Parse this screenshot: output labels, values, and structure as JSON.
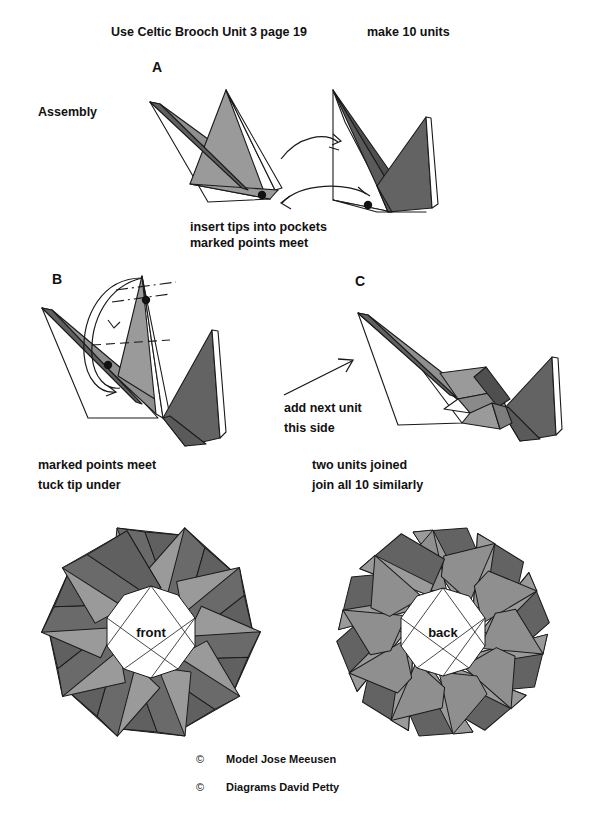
{
  "document": {
    "type": "origami-instruction-diagram",
    "title_line": "Use Celtic Brooch Unit 3 page 19",
    "units_note": "make 10 units",
    "section_label": "Assembly"
  },
  "steps": [
    {
      "id": "A",
      "label": "A",
      "caption_lines": [
        "insert tips into pockets",
        "marked points meet"
      ]
    },
    {
      "id": "B",
      "label": "B",
      "caption_lines": [
        "marked points meet",
        "tuck tip under"
      ]
    },
    {
      "id": "C",
      "label": "C",
      "caption_lines": [
        "two units joined",
        "join all 10 similarly"
      ],
      "annotation_lines": [
        "add next unit",
        "this side"
      ]
    }
  ],
  "results": [
    {
      "id": "front",
      "label": "front",
      "units": 10
    },
    {
      "id": "back",
      "label": "back",
      "units": 10
    }
  ],
  "credits": [
    {
      "symbol": "©",
      "text": "Model Jose Meeusen"
    },
    {
      "symbol": "©",
      "text": "Diagrams David Petty"
    }
  ],
  "colors": {
    "paper_white": "#ffffff",
    "light_gray": "#9a9a9a",
    "mid_gray": "#808080",
    "dark_gray": "#636363",
    "darker_gray": "#555555",
    "outline": "#1a1a1a",
    "text": "#111111"
  }
}
